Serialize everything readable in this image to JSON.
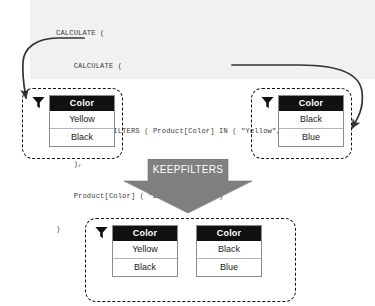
{
  "code": {
    "lines": [
      "CALCULATE (",
      "    CALCULATE (",
      "        ...,",
      "        KEEPFILTERS ( Product[Color] IN ( \"Yellow\", \"Black\" ) )",
      "    ),",
      "    Product[Color] ( \"Black\", \"Blue\" )",
      ")"
    ],
    "background": "#f1f1f1",
    "text_color": "#3a3a3a"
  },
  "operator": {
    "label": "KEEPFILTERS",
    "fill": "#808080",
    "text_color": "#ffffff"
  },
  "tables": {
    "left": {
      "header": "Color",
      "rows": [
        "Yellow",
        "Black"
      ],
      "icon": "filter-funnel-icon"
    },
    "right": {
      "header": "Color",
      "rows": [
        "Black",
        "Blue"
      ],
      "icon": "filter-funnel-icon"
    },
    "result_a": {
      "header": "Color",
      "rows": [
        "Yellow",
        "Black"
      ],
      "icon": "filter-funnel-icon"
    },
    "result_b": {
      "header": "Color",
      "rows": [
        "Black",
        "Blue"
      ]
    }
  },
  "colors": {
    "header_bg": "#111111",
    "header_fg": "#ffffff",
    "dash_border": "#111111",
    "table_border": "#8c8c8c",
    "arrow_stroke": "#333333"
  }
}
